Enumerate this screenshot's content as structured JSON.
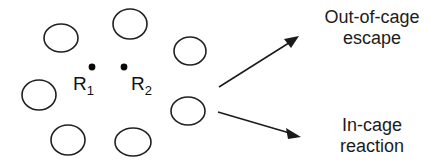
{
  "figure": {
    "width": 441,
    "height": 166,
    "background_color": "#ffffff",
    "stroke_color": "#231f20",
    "text_color": "#1c1c1c"
  },
  "cage": {
    "description": "Ring of eight open solvent-molecule circles forming a cage",
    "circles": [
      {
        "id": "solvent-circle-1",
        "cx": 61,
        "cy": 38,
        "rx": 17,
        "ry": 14
      },
      {
        "id": "solvent-circle-2",
        "cx": 130,
        "cy": 24,
        "rx": 17,
        "ry": 15
      },
      {
        "id": "solvent-circle-3",
        "cx": 190,
        "cy": 51,
        "rx": 16,
        "ry": 14
      },
      {
        "id": "solvent-circle-4",
        "cx": 188,
        "cy": 111,
        "rx": 17,
        "ry": 14
      },
      {
        "id": "solvent-circle-5",
        "cx": 133,
        "cy": 142,
        "rx": 18,
        "ry": 14
      },
      {
        "id": "solvent-circle-6",
        "cx": 68,
        "cy": 140,
        "rx": 17,
        "ry": 15
      },
      {
        "id": "solvent-circle-7",
        "cx": 39,
        "cy": 95,
        "rx": 17,
        "ry": 15
      }
    ]
  },
  "radicals": [
    {
      "id": "radical-R1",
      "symbol": "R",
      "subscript": "1",
      "label_x": 73,
      "label_y": 90,
      "dot_x": 92,
      "dot_y": 67,
      "dot_r": 3.4
    },
    {
      "id": "radical-R2",
      "symbol": "R",
      "subscript": "2",
      "label_x": 131,
      "label_y": 90,
      "dot_x": 124,
      "dot_y": 67,
      "dot_r": 3.4
    }
  ],
  "arrows": [
    {
      "id": "arrow-out-of-cage",
      "x1": 219,
      "y1": 87,
      "x2": 298,
      "y2": 37,
      "direction": "up-right"
    },
    {
      "id": "arrow-in-cage",
      "x1": 218,
      "y1": 112,
      "x2": 300,
      "y2": 137,
      "direction": "down-right"
    }
  ],
  "labels": {
    "out_of_cage": "Out-of-cage\nescape",
    "in_cage": "In-cage\nreaction"
  },
  "watermark": {
    "text": "",
    "color": "#fdfdfd"
  }
}
